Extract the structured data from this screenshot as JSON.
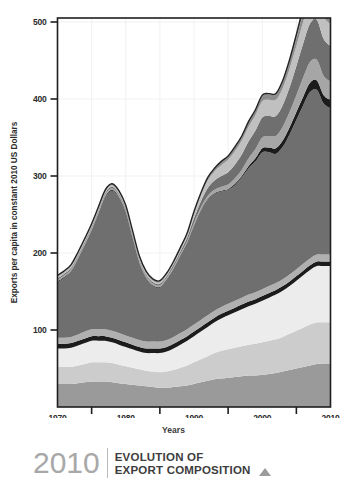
{
  "footer": {
    "year": "2010",
    "title_line1": "EVOLUTION OF",
    "title_line2": "EXPORT COMPOSITION",
    "arrow_icon": "triangle-up-icon"
  },
  "chart_data": {
    "type": "area",
    "stacked": true,
    "title": "",
    "xlabel": "Years",
    "ylabel": "Exports per capita in constant 2010 US Dollars",
    "xlim": [
      1970,
      2010
    ],
    "ylim": [
      0,
      520
    ],
    "ytick_labels": [
      "100",
      "200",
      "300",
      "400",
      "500"
    ],
    "ytick_values": [
      100,
      200,
      300,
      400,
      500
    ],
    "xtick_labels": [
      "1970",
      "1980",
      "1990",
      "2000",
      "2010"
    ],
    "xtick_values": [
      1970,
      1980,
      1990,
      2000,
      2010
    ],
    "minor_xticks": [
      1975,
      1985,
      1995,
      2005
    ],
    "grid": "light-vertical-and-horizontal",
    "legend": "none",
    "x": [
      1970,
      1971,
      1972,
      1973,
      1974,
      1975,
      1976,
      1977,
      1978,
      1979,
      1980,
      1981,
      1982,
      1983,
      1984,
      1985,
      1986,
      1987,
      1988,
      1989,
      1990,
      1991,
      1992,
      1993,
      1994,
      1995,
      1996,
      1997,
      1998,
      1999,
      2000,
      2001,
      2002,
      2003,
      2004,
      2005,
      2006,
      2007,
      2008,
      2009,
      2010
    ],
    "series": [
      {
        "name": "layer-1",
        "color": "#9a9a9a",
        "values": [
          30,
          30,
          30,
          31,
          32,
          33,
          33,
          33,
          32,
          31,
          30,
          29,
          28,
          27,
          26,
          25,
          25,
          26,
          27,
          28,
          30,
          32,
          34,
          36,
          37,
          38,
          39,
          40,
          41,
          41,
          42,
          43,
          44,
          46,
          48,
          50,
          52,
          54,
          56,
          56,
          56
        ]
      },
      {
        "name": "layer-2",
        "color": "#cccccc",
        "values": [
          22,
          22,
          22,
          23,
          24,
          25,
          25,
          25,
          25,
          24,
          23,
          22,
          21,
          20,
          20,
          20,
          21,
          22,
          24,
          26,
          28,
          30,
          32,
          34,
          36,
          37,
          38,
          39,
          40,
          41,
          42,
          43,
          44,
          45,
          47,
          49,
          51,
          53,
          54,
          54,
          54
        ]
      },
      {
        "name": "layer-3",
        "color": "#ececec",
        "values": [
          24,
          24,
          25,
          26,
          27,
          28,
          28,
          28,
          27,
          26,
          25,
          24,
          23,
          23,
          24,
          25,
          26,
          28,
          30,
          32,
          34,
          36,
          38,
          40,
          42,
          44,
          46,
          48,
          50,
          52,
          54,
          56,
          58,
          60,
          62,
          65,
          68,
          71,
          73,
          73,
          73
        ]
      },
      {
        "name": "layer-4",
        "color": "#1c1c1c",
        "values": [
          6,
          6,
          6,
          6,
          6,
          6,
          6,
          6,
          6,
          6,
          6,
          6,
          6,
          6,
          6,
          6,
          6,
          6,
          6,
          6,
          6,
          6,
          6,
          6,
          6,
          6,
          6,
          6,
          6,
          6,
          6,
          6,
          6,
          6,
          6,
          6,
          6,
          6,
          6,
          6,
          6
        ]
      },
      {
        "name": "layer-5",
        "color": "#b0b0b0",
        "values": [
          8,
          8,
          8,
          8,
          9,
          9,
          9,
          9,
          9,
          9,
          9,
          9,
          9,
          9,
          9,
          9,
          9,
          9,
          9,
          9,
          9,
          9,
          9,
          9,
          9,
          9,
          9,
          9,
          9,
          9,
          9,
          9,
          9,
          9,
          9,
          9,
          9,
          9,
          9,
          9,
          9
        ]
      },
      {
        "name": "layer-6",
        "color": "#6f6f6f",
        "values": [
          72,
          78,
          85,
          98,
          112,
          128,
          150,
          172,
          182,
          176,
          160,
          130,
          100,
          82,
          72,
          70,
          78,
          88,
          100,
          112,
          128,
          142,
          150,
          152,
          150,
          148,
          150,
          156,
          164,
          170,
          178,
          174,
          168,
          172,
          182,
          194,
          206,
          216,
          214,
          196,
          190
        ]
      },
      {
        "name": "layer-7",
        "color": "#1c1c1c",
        "values": [
          1,
          1,
          1,
          1,
          1,
          1,
          1,
          1,
          1,
          1,
          1,
          1,
          1,
          1,
          1,
          1,
          1,
          1,
          1,
          1,
          1,
          1,
          1,
          1,
          1,
          1,
          2,
          2,
          3,
          4,
          5,
          6,
          7,
          8,
          9,
          10,
          11,
          12,
          12,
          11,
          11
        ]
      },
      {
        "name": "layer-8",
        "color": "#a6a6a6",
        "values": [
          2,
          2,
          2,
          2,
          2,
          2,
          2,
          2,
          2,
          2,
          2,
          2,
          2,
          2,
          2,
          2,
          2,
          2,
          2,
          2,
          3,
          3,
          4,
          4,
          5,
          6,
          7,
          8,
          10,
          12,
          14,
          15,
          16,
          18,
          20,
          22,
          25,
          27,
          27,
          25,
          24
        ]
      },
      {
        "name": "layer-9",
        "color": "#6f6f6f",
        "values": [
          2,
          2,
          2,
          2,
          2,
          2,
          2,
          2,
          2,
          2,
          2,
          2,
          2,
          2,
          2,
          2,
          2,
          3,
          3,
          4,
          6,
          8,
          10,
          12,
          14,
          16,
          18,
          20,
          22,
          24,
          26,
          26,
          26,
          28,
          32,
          38,
          44,
          50,
          52,
          48,
          46
        ]
      },
      {
        "name": "layer-10",
        "color": "#c0c0c0",
        "values": [
          2,
          2,
          2,
          2,
          2,
          2,
          2,
          2,
          2,
          2,
          2,
          2,
          2,
          2,
          2,
          2,
          2,
          2,
          3,
          4,
          6,
          8,
          10,
          12,
          14,
          16,
          17,
          18,
          19,
          20,
          21,
          21,
          21,
          22,
          24,
          26,
          28,
          30,
          31,
          29,
          28
        ]
      },
      {
        "name": "layer-11",
        "color": "#8d8d8d",
        "values": [
          1,
          1,
          1,
          1,
          1,
          1,
          1,
          1,
          1,
          1,
          1,
          1,
          1,
          1,
          1,
          1,
          1,
          1,
          1,
          1,
          2,
          2,
          3,
          3,
          4,
          4,
          5,
          5,
          6,
          6,
          7,
          7,
          7,
          8,
          9,
          10,
          11,
          12,
          12,
          11,
          11
        ]
      },
      {
        "name": "layer-12",
        "color": "#7b7b7b",
        "values": [
          1,
          1,
          1,
          1,
          1,
          1,
          1,
          1,
          1,
          1,
          1,
          1,
          1,
          1,
          1,
          1,
          1,
          1,
          1,
          1,
          1,
          1,
          1,
          1,
          1,
          1,
          1,
          1,
          1,
          1,
          1,
          1,
          1,
          2,
          3,
          5,
          8,
          12,
          14,
          13,
          12
        ]
      }
    ],
    "totals_note": "stacked totals: ~170 in 1970, peak ~310 near 1978, trough ~162 in 1985, ~335 plateau 1998-2002, peak ~510 in 2010"
  }
}
